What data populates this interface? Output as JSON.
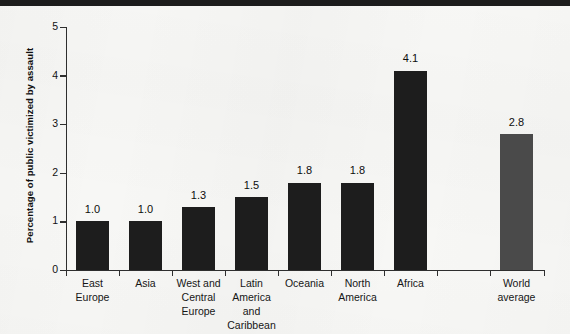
{
  "figure": {
    "background_color": "#f7f7f5",
    "top_band_color": "#1c1c1c",
    "axis_color": "#2e2e2e"
  },
  "chart_data": {
    "type": "bar",
    "title": "",
    "xlabel": "",
    "ylabel": "Percentage of public victimized by assault",
    "ylim": [
      0,
      5
    ],
    "yticks": [
      "0",
      "1",
      "2",
      "3",
      "4",
      "5"
    ],
    "grid": false,
    "legend": "none",
    "categories": [
      "East Europe",
      "Asia",
      "West and Central Europe",
      "Latin America and Caribbean",
      "Oceania",
      "North America",
      "Africa",
      "World average"
    ],
    "values": [
      1.0,
      1.0,
      1.3,
      1.5,
      1.8,
      1.8,
      4.1,
      2.8
    ],
    "value_labels": [
      "1.0",
      "1.0",
      "1.3",
      "1.5",
      "1.8",
      "1.8",
      "4.1",
      "2.8"
    ],
    "bar_colors": [
      "#1d1d1d",
      "#1d1d1d",
      "#1d1d1d",
      "#1d1d1d",
      "#1d1d1d",
      "#1d1d1d",
      "#1d1d1d",
      "#4a4a4a"
    ],
    "category_lines": [
      [
        "East",
        "Europe"
      ],
      [
        "Asia"
      ],
      [
        "West and",
        "Central",
        "Europe"
      ],
      [
        "Latin",
        "America",
        "and",
        "Caribbean"
      ],
      [
        "Oceania"
      ],
      [
        "North",
        "America"
      ],
      [
        "Africa"
      ],
      [
        "World",
        "average"
      ]
    ]
  }
}
